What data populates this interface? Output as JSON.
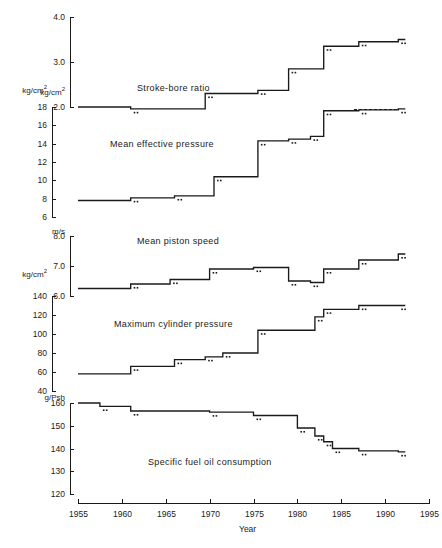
{
  "chart_data": {
    "type": "line",
    "title": "",
    "xlabel": "Year",
    "xlim": [
      1955,
      1995
    ],
    "xticks": [
      1955,
      1960,
      1965,
      1970,
      1975,
      1980,
      1985,
      1990,
      1995
    ],
    "xtick_labels": [
      "1955",
      "1960",
      "1965",
      "1970",
      "1975",
      "1980",
      "1985",
      "1990",
      "1995"
    ],
    "grid": false,
    "legend": "none",
    "line_color": "#1a1a1a",
    "step_style": "post",
    "panels": [
      {
        "name": "Stroke-bore ratio",
        "unit": "kg/cm2",
        "unit_label": "kg/cm",
        "unit_sup": "2",
        "ylim": [
          2.0,
          4.0
        ],
        "yticks": [
          2.0,
          3.0,
          4.0
        ],
        "ytick_labels": [
          "2.0",
          "3.0",
          "4.0"
        ],
        "x": [
          1955,
          1961,
          1969.5,
          1975.5,
          1979,
          1983,
          1987,
          1991.5
        ],
        "y": [
          2.0,
          1.96,
          2.3,
          2.37,
          2.85,
          3.35,
          3.45,
          3.5
        ]
      },
      {
        "name": "Mean effective pressure",
        "unit": "kg/cm2",
        "unit_label": "kg/cm",
        "unit_sup": "2",
        "ylim": [
          6,
          18
        ],
        "yticks": [
          6,
          8,
          10,
          12,
          14,
          16,
          18
        ],
        "ytick_labels": [
          "6",
          "8",
          "10",
          "12",
          "14",
          "16",
          "18"
        ],
        "x": [
          1955,
          1961,
          1966,
          1970.5,
          1975.5,
          1979,
          1981.5,
          1983,
          1987,
          1991.5
        ],
        "y": [
          7.8,
          8.1,
          8.3,
          10.4,
          14.3,
          14.5,
          14.8,
          17.6,
          17.7,
          17.8
        ]
      },
      {
        "name": "Mean piston speed",
        "unit": "m/s",
        "unit_label": "m/s",
        "unit_sup": "",
        "ylim": [
          6.0,
          8.0
        ],
        "yticks": [
          6.0,
          7.0,
          8.0
        ],
        "ytick_labels": [
          "6.0",
          "7.0",
          "8.0"
        ],
        "x": [
          1955,
          1961,
          1965.5,
          1970,
          1975,
          1979,
          1981.5,
          1983,
          1987,
          1991.5
        ],
        "y": [
          6.25,
          6.4,
          6.55,
          6.9,
          6.95,
          6.5,
          6.45,
          6.9,
          7.2,
          7.4
        ]
      },
      {
        "name": "Maximum cylinder pressure",
        "unit": "kg/cm2",
        "unit_label": "kg/cm",
        "unit_sup": "2",
        "ylim": [
          40,
          140
        ],
        "yticks": [
          40,
          60,
          80,
          100,
          120,
          140
        ],
        "ytick_labels": [
          "40",
          "60",
          "80",
          "100",
          "120",
          "140"
        ],
        "x": [
          1955,
          1961,
          1966,
          1969.5,
          1971.5,
          1975.5,
          1982,
          1983,
          1987,
          1991.5
        ],
        "y": [
          58,
          66,
          73,
          76,
          80,
          104,
          118,
          126,
          130,
          130
        ]
      },
      {
        "name": "Specific fuel oil consumption",
        "unit": "g/Psh",
        "unit_label": "g/Psh",
        "unit_sup": "",
        "ylim": [
          120,
          160
        ],
        "yticks": [
          120,
          130,
          140,
          150,
          160
        ],
        "ytick_labels": [
          "120",
          "130",
          "140",
          "150",
          "160"
        ],
        "x": [
          1955,
          1957.5,
          1961,
          1970,
          1975,
          1980,
          1982,
          1983,
          1984,
          1987,
          1991.5
        ],
        "y": [
          160,
          158.5,
          156.5,
          156,
          154.5,
          149,
          145.5,
          143,
          140,
          139,
          138.5
        ]
      }
    ]
  }
}
